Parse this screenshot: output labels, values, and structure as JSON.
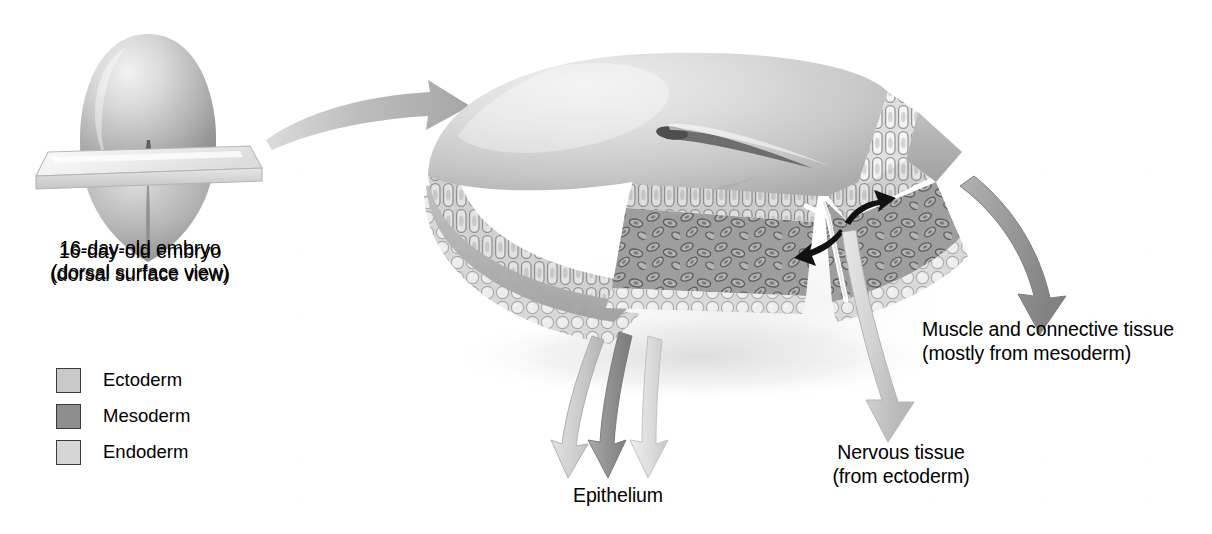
{
  "figure": {
    "background_color": "#ffffff"
  },
  "embryo_inset": {
    "caption_line1": "16-day-old embryo",
    "caption_line2": "(dorsal surface view)",
    "body_color": "#b9b9b9",
    "plane_color": "#eeeeee",
    "groove_color": "#6e6e6e"
  },
  "transition_arrow": {
    "name": "magnify-arrow",
    "color": "#b0b0b0"
  },
  "block": {
    "top_surface_color": "#d2d2d2",
    "primitive_streak_color": "#6b6b6b",
    "ectoderm_color": "#c9c9c9",
    "mesoderm_color": "#9a9a9a",
    "endoderm_color": "#e4e4e4",
    "shadow_color": "#e8e8e8"
  },
  "legend": {
    "items": [
      {
        "label": "Ectoderm",
        "color": "#c9c9c9"
      },
      {
        "label": "Mesoderm",
        "color": "#8e8e8e"
      },
      {
        "label": "Endoderm",
        "color": "#d6d6d6"
      }
    ]
  },
  "callouts": [
    {
      "id": "epithelium",
      "line1": "Epithelium",
      "line2": "",
      "arrow_colors": [
        "#c9c9c9",
        "#8e8e8e",
        "#dcdcdc"
      ]
    },
    {
      "id": "nervous-tissue",
      "line1": "Nervous tissue",
      "line2": "(from ectoderm)",
      "arrow_colors": [
        "#d2d2d2"
      ]
    },
    {
      "id": "muscle-connective-tissue",
      "line1": "Muscle and connective tissue",
      "line2": "(mostly from mesoderm)",
      "arrow_colors": [
        "#9a9a9a"
      ]
    }
  ],
  "migration_arrows": {
    "name": "cell-migration-arrows",
    "color": "#111111",
    "count": 2
  }
}
